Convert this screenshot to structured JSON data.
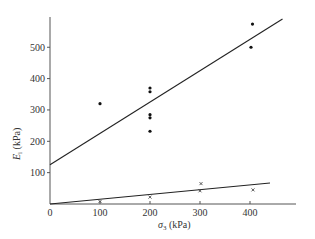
{
  "chart_data": {
    "type": "scatter",
    "title": "",
    "xlabel": "σ3 (kPa)",
    "ylabel": "Ei (kPa)",
    "xlim": [
      0,
      490
    ],
    "ylim": [
      0,
      630
    ],
    "grid": false,
    "legend": null,
    "x_ticks": [
      0,
      100,
      200,
      300,
      400
    ],
    "y_ticks": [
      100,
      200,
      300,
      400,
      500
    ],
    "series": [
      {
        "name": "dots",
        "marker": "dot",
        "points": [
          {
            "x": 100,
            "y": 320
          },
          {
            "x": 200,
            "y": 370
          },
          {
            "x": 200,
            "y": 358
          },
          {
            "x": 200,
            "y": 285
          },
          {
            "x": 200,
            "y": 275
          },
          {
            "x": 200,
            "y": 232
          },
          {
            "x": 405,
            "y": 574
          },
          {
            "x": 402,
            "y": 500
          }
        ]
      },
      {
        "name": "crosses",
        "marker": "cross",
        "points": [
          {
            "x": 100,
            "y": 8
          },
          {
            "x": 200,
            "y": 22
          },
          {
            "x": 302,
            "y": 65
          },
          {
            "x": 300,
            "y": 42
          },
          {
            "x": 406,
            "y": 45
          }
        ]
      }
    ],
    "lines": [
      {
        "name": "upper-fit",
        "x": [
          0,
          465
        ],
        "y": [
          125,
          590
        ]
      },
      {
        "name": "lower-fit",
        "x": [
          0,
          440
        ],
        "y": [
          0,
          67
        ]
      }
    ]
  },
  "axes": {
    "x_label_symbol": "σ",
    "x_label_sub": "3",
    "x_label_unit": " (kPa)",
    "y_label_symbol": "E",
    "y_label_sub": "i",
    "y_label_unit": " (kPa)",
    "x_tick_labels": [
      "0",
      "100",
      "200",
      "300",
      "400"
    ],
    "y_tick_labels": [
      "100",
      "200",
      "300",
      "400",
      "500"
    ]
  }
}
